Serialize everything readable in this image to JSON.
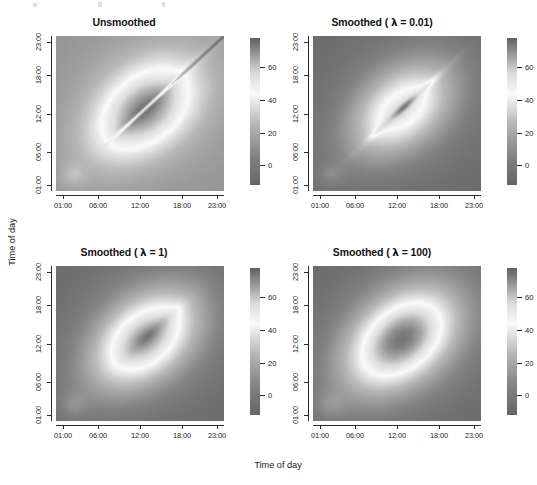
{
  "figure": {
    "x_axis_title": "Time of day",
    "y_axis_title": "Time of day",
    "background": "#ffffff",
    "grid": "2x2"
  },
  "chart_data": {
    "type": "heatmap",
    "title": "",
    "xlabel": "Time of day",
    "ylabel": "Time of day",
    "grid": false,
    "legend_position": "right-of-each-panel",
    "colormap": "grayscale",
    "colorbar": {
      "ticks": [
        0,
        20,
        40,
        60
      ],
      "tick_labels": [
        "0",
        "20",
        "40",
        "60"
      ],
      "vmin": -12,
      "vmax": 78,
      "orientation": "vertical"
    },
    "axis": {
      "x_ticks": [
        "01:00",
        "06:00",
        "12:00",
        "18:00",
        "23:00"
      ],
      "y_ticks": [
        "01:00",
        "06:00",
        "12:00",
        "18:00",
        "23:00"
      ],
      "x_tick_positions": [
        1,
        6,
        12,
        18,
        23
      ],
      "y_tick_positions": [
        1,
        6,
        12,
        18,
        23
      ],
      "xlim": [
        0,
        24
      ],
      "ylim": [
        0,
        24
      ]
    },
    "panels": [
      {
        "id": "unsmoothed",
        "title": "Unsmoothed",
        "lambda": null,
        "smoothing": 0,
        "diagonal_ridge": "sharp-dark-line",
        "description": "Raw covariance surface with sharp dark diagonal and bright central diamond"
      },
      {
        "id": "smoothed-0.01",
        "title_prefix": "Smoothed ( ",
        "title_lambda": "λ",
        "title_suffix": " = 0.01)",
        "title": "Smoothed ( λ = 0.01)",
        "lambda": 0.01,
        "smoothing": 0.01,
        "diagonal_ridge": "bright-broken-ridge",
        "description": "Lightly smoothed; diagonal ridge becomes a bright broken band"
      },
      {
        "id": "smoothed-1",
        "title_prefix": "Smoothed ( ",
        "title_lambda": "λ",
        "title_suffix": " = 1)",
        "title": "Smoothed ( λ = 1)",
        "lambda": 1,
        "smoothing": 1,
        "diagonal_ridge": "faint-ridge",
        "description": "Moderately smoothed; diamond broadens, faint diagonal ridge remains"
      },
      {
        "id": "smoothed-100",
        "title_prefix": "Smoothed ( ",
        "title_lambda": "λ",
        "title_suffix": " = 100)",
        "title": "Smoothed ( λ = 100)",
        "lambda": 100,
        "smoothing": 100,
        "diagonal_ridge": "none",
        "description": "Heavily smoothed; smooth elliptical bright region, no diagonal feature"
      }
    ],
    "value_range_observed": [
      -10,
      75
    ]
  }
}
